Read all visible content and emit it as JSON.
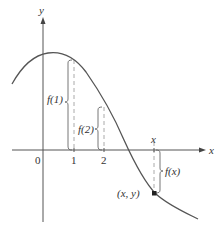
{
  "axes": {
    "x_label": "x",
    "y_label": "y",
    "origin_label": "0",
    "ticks": [
      {
        "label": "1"
      },
      {
        "label": "2"
      },
      {
        "label": "x"
      }
    ]
  },
  "annotations": {
    "f1": "f(1)",
    "f2": "f(2)",
    "fx": "f(x)",
    "point": "(x, y)"
  },
  "colors": {
    "curve": "#555555",
    "axes": "#555555",
    "dashed": "#aaaaaa",
    "text": "#333333"
  }
}
